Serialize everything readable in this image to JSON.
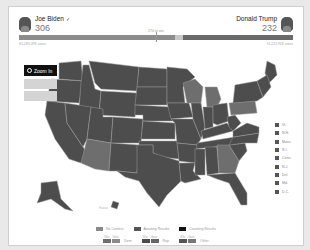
{
  "header": {
    "left_candidate": {
      "name": "Joe Biden",
      "electoral_votes": "306",
      "winner_mark": "✓",
      "popular_votes": "81,283,098 votes"
    },
    "right_candidate": {
      "name": "Donald Trump",
      "electoral_votes": "232",
      "popular_votes": "74,222,958 votes"
    },
    "win_threshold_label": "270 to win"
  },
  "controls": {
    "zoom_in_label": "Zoom In"
  },
  "colors": {
    "dem": "#8c8c8c",
    "rep": "#5a5a5a",
    "state_fill": "#4d4d4d",
    "state_light": "#7a7a7a",
    "state_border": "#9a9a9a",
    "background": "#ffffff"
  },
  "small_states_legend": [
    "Vt.",
    "N.H.",
    "Mass.",
    "R.I.",
    "Conn.",
    "N.J.",
    "Del.",
    "Md.",
    "D.C."
  ],
  "map_labels": {
    "hawaii": "Hawaii"
  },
  "legend": {
    "status": [
      {
        "label": "No Contest",
        "color": "#888888"
      },
      {
        "label": "Awaiting Results",
        "color": "#555555"
      },
      {
        "label": "Counting Results",
        "color": "#111111"
      }
    ],
    "margin_groups": [
      {
        "heads": [
          "Win",
          "Gain"
        ],
        "label": "Dem",
        "colors": [
          "#6e6e6e",
          "#8a8a8a"
        ]
      },
      {
        "heads": [
          "Win",
          "Gain"
        ],
        "label": "Rep",
        "colors": [
          "#4a4a4a",
          "#666666"
        ]
      },
      {
        "heads": [
          "Win",
          "Gain"
        ],
        "label": "Other",
        "colors": [
          "#555555",
          "#777777"
        ]
      }
    ]
  }
}
